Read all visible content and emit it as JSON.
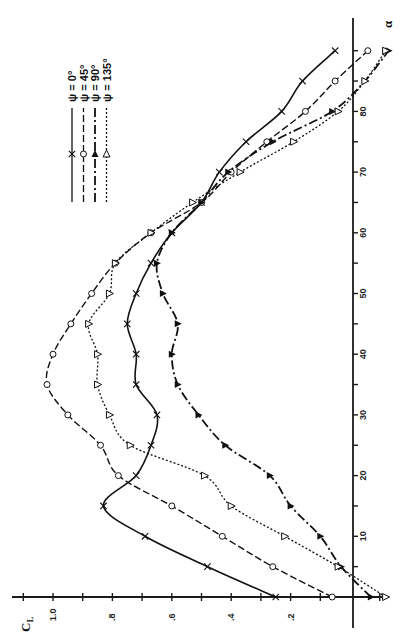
{
  "chart_data": {
    "type": "line",
    "orientation": "rotated-90-ccw",
    "title": "",
    "xlabel": "α",
    "ylabel": "C_L",
    "x_axis": {
      "label": "α",
      "range": [
        0,
        90
      ],
      "ticks": [
        10,
        20,
        30,
        40,
        50,
        60,
        70,
        80
      ],
      "tick_labels": [
        "10",
        "20",
        "30",
        "40",
        "50",
        "60",
        "70",
        "80"
      ]
    },
    "y_axis": {
      "label": "C_L",
      "range": [
        -0.15,
        1.1
      ],
      "ticks": [
        0.2,
        0.4,
        0.6,
        0.8,
        1.0
      ],
      "tick_labels": [
        ".2",
        ".4",
        ".6",
        ".8",
        "1.0"
      ],
      "minor_ticks": [
        -0.1,
        0.1,
        0.3,
        0.5,
        0.7,
        0.9,
        1.1
      ]
    },
    "grid": false,
    "legend_position": "upper-left (rotated)",
    "x": [
      0,
      5,
      10,
      15,
      20,
      25,
      30,
      35,
      40,
      45,
      50,
      55,
      60,
      65,
      70,
      75,
      80,
      85,
      90
    ],
    "series": [
      {
        "name": "ψ = 0°",
        "marker": "x",
        "line": "solid",
        "values": [
          0.25,
          0.48,
          0.69,
          0.83,
          0.72,
          0.67,
          0.65,
          0.72,
          0.72,
          0.75,
          0.72,
          0.67,
          0.6,
          0.5,
          0.44,
          0.35,
          0.23,
          0.16,
          0.05
        ]
      },
      {
        "name": "ψ = 45°",
        "marker": "circle",
        "line": "dashed",
        "values": [
          0.06,
          0.26,
          0.43,
          0.6,
          0.78,
          0.84,
          0.95,
          1.02,
          1.0,
          0.94,
          0.87,
          0.79,
          0.67,
          0.5,
          0.4,
          0.28,
          0.15,
          0.05,
          -0.06
        ]
      },
      {
        "name": "ψ = 90°",
        "marker": "filled-triangle",
        "line": "dash-dot",
        "values": [
          -0.07,
          0.03,
          0.1,
          0.2,
          0.27,
          0.42,
          0.51,
          0.58,
          0.6,
          0.58,
          0.63,
          0.65,
          0.6,
          0.5,
          0.41,
          0.26,
          0.06,
          -0.05,
          -0.13
        ]
      },
      {
        "name": "ψ = 135°",
        "marker": "open-triangle",
        "line": "dotted",
        "values": [
          -0.12,
          0.04,
          0.22,
          0.4,
          0.49,
          0.74,
          0.81,
          0.85,
          0.85,
          0.88,
          0.81,
          0.79,
          0.67,
          0.53,
          0.37,
          0.19,
          0.04,
          -0.05,
          -0.12
        ]
      }
    ]
  },
  "legend": {
    "items": [
      {
        "label": "ψ = 0°",
        "marker": "x",
        "dash": ""
      },
      {
        "label": "ψ = 45°",
        "marker": "circle",
        "dash": "7,3"
      },
      {
        "label": "ψ = 90°",
        "marker": "filled-triangle",
        "dash": "9,3,2,3"
      },
      {
        "label": "ψ = 135°",
        "marker": "open-triangle",
        "dash": "2,2"
      }
    ]
  },
  "axes": {
    "alpha_label": "α",
    "cl_label": "C",
    "cl_subscript": "L"
  }
}
